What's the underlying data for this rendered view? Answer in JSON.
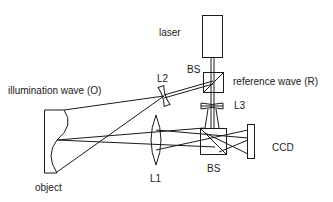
{
  "diagram": {
    "labels": {
      "laser": "laser",
      "bs_top": "BS",
      "reference_wave": "reference wave (R)",
      "l2": "L2",
      "illumination_wave": "illumination wave (O)",
      "l3": "L3",
      "ccd": "CCD",
      "object": "object",
      "l1": "L1",
      "bs_bottom": "BS"
    },
    "colors": {
      "stroke": "#1a1a1a",
      "background": "#ffffff"
    },
    "components": [
      {
        "id": "laser",
        "type": "source"
      },
      {
        "id": "bs_top",
        "type": "beam-splitter"
      },
      {
        "id": "l2",
        "type": "diverging-lens"
      },
      {
        "id": "l3",
        "type": "diverging-lens"
      },
      {
        "id": "l1",
        "type": "converging-lens"
      },
      {
        "id": "bs_bottom",
        "type": "beam-splitter"
      },
      {
        "id": "ccd",
        "type": "sensor"
      },
      {
        "id": "object",
        "type": "object"
      }
    ]
  }
}
